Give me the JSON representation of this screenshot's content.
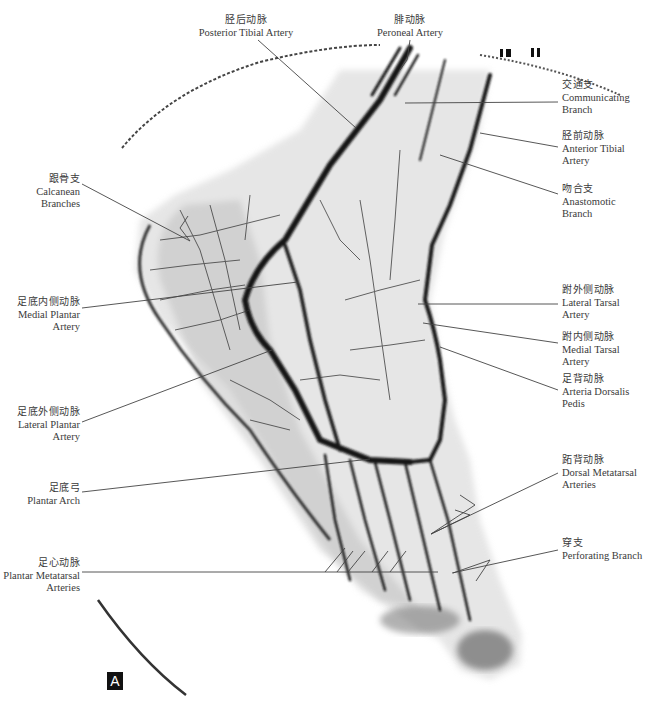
{
  "figure": {
    "panel_label": "A",
    "ruler_marks": "10 11",
    "labels": [
      {
        "id": "posterior-tibial-artery",
        "zh": "胫后动脉",
        "en": [
          "Posterior Tibial Artery"
        ],
        "x": 246,
        "y": 14,
        "align": "center",
        "leader": [
          [
            258,
            40
          ],
          [
            356,
            128
          ]
        ]
      },
      {
        "id": "peroneal-artery",
        "zh": "腓动脉",
        "en": [
          "Peroneal Artery"
        ],
        "x": 410,
        "y": 14,
        "align": "center",
        "leader": [
          [
            410,
            40
          ],
          [
            407,
            60
          ],
          [
            400,
            70
          ]
        ]
      },
      {
        "id": "communicating-branch",
        "zh": "交通支",
        "en": [
          "Communicating",
          "Branch"
        ],
        "x": 562,
        "y": 79,
        "align": "left",
        "leader": [
          [
            558,
            102
          ],
          [
            405,
            103
          ]
        ]
      },
      {
        "id": "anterior-tibial-artery",
        "zh": "胫前动脉",
        "en": [
          "Anterior Tibial",
          "Artery"
        ],
        "x": 562,
        "y": 130,
        "align": "left",
        "leader": [
          [
            558,
            147
          ],
          [
            480,
            133
          ]
        ]
      },
      {
        "id": "anastomotic-branch",
        "zh": "吻合支",
        "en": [
          "Anastomotic",
          "Branch"
        ],
        "x": 562,
        "y": 183,
        "align": "left",
        "leader": [
          [
            558,
            194
          ],
          [
            440,
            155
          ]
        ]
      },
      {
        "id": "calcanean-branches",
        "zh": "跟骨支",
        "en": [
          "Calcanean",
          "Branches"
        ],
        "x": 8,
        "y": 173,
        "align": "right",
        "leader": [
          [
            82,
            184
          ],
          [
            190,
            241
          ]
        ]
      },
      {
        "id": "medial-plantar-artery",
        "zh": "足底内侧动脉",
        "en": [
          "Medial Plantar",
          "Artery"
        ],
        "x": 8,
        "y": 296,
        "align": "right",
        "leader": [
          [
            82,
            308
          ],
          [
            298,
            282
          ]
        ]
      },
      {
        "id": "lateral-tarsal-artery",
        "zh": "跗外侧动脉",
        "en": [
          "Lateral Tarsal",
          "Artery"
        ],
        "x": 562,
        "y": 284,
        "align": "left",
        "leader": [
          [
            558,
            304
          ],
          [
            418,
            304
          ]
        ]
      },
      {
        "id": "medial-tarsal-artery",
        "zh": "跗内侧动脉",
        "en": [
          "Medial Tarsal",
          "Artery"
        ],
        "x": 562,
        "y": 331,
        "align": "left",
        "leader": [
          [
            558,
            343
          ],
          [
            423,
            323
          ]
        ]
      },
      {
        "id": "arteria-dorsalis-pedis",
        "zh": "足背动脉",
        "en": [
          "Arteria Dorsalis",
          "Pedis"
        ],
        "x": 562,
        "y": 373,
        "align": "left",
        "leader": [
          [
            558,
            390
          ],
          [
            440,
            347
          ]
        ]
      },
      {
        "id": "lateral-plantar-artery",
        "zh": "足底外侧动脉",
        "en": [
          "Lateral Plantar",
          "Artery"
        ],
        "x": 8,
        "y": 406,
        "align": "right",
        "leader": [
          [
            82,
            422
          ],
          [
            272,
            350
          ]
        ]
      },
      {
        "id": "plantar-arch",
        "zh": "足底弓",
        "en": [
          "Plantar Arch"
        ],
        "x": 8,
        "y": 482,
        "align": "right",
        "leader": [
          [
            82,
            492
          ],
          [
            370,
            459
          ]
        ]
      },
      {
        "id": "dorsal-metatarsal-arteries",
        "zh": "跖背动脉",
        "en": [
          "Dorsal Metatarsal",
          "Arteries"
        ],
        "x": 562,
        "y": 454,
        "align": "left",
        "leader": [
          [
            558,
            473
          ],
          [
            431,
            534
          ]
        ]
      },
      {
        "id": "perforating-branch",
        "zh": "穿支",
        "en": [
          "Perforating Branch"
        ],
        "x": 562,
        "y": 537,
        "align": "left",
        "leader": [
          [
            558,
            550
          ],
          [
            452,
            573
          ]
        ]
      },
      {
        "id": "plantar-metatarsal-arteries",
        "zh": "足心动脉",
        "en": [
          "Plantar Metatarsal",
          "Arteries"
        ],
        "x": 8,
        "y": 557,
        "align": "right",
        "leader": [
          [
            82,
            572
          ],
          [
            438,
            572
          ]
        ]
      }
    ]
  }
}
